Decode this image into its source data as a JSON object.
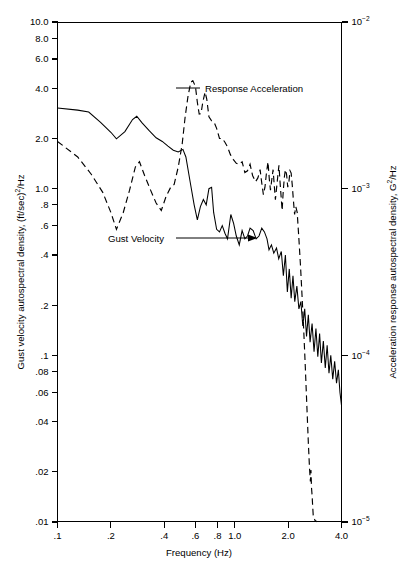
{
  "figure": {
    "background": "#ffffff",
    "ink": "#000000"
  },
  "axes": {
    "x": {
      "title": "Frequency (Hz)",
      "scale": "log",
      "range": [
        0.1,
        4.0
      ],
      "ticks": [
        0.1,
        0.2,
        0.4,
        0.6,
        0.8,
        1.0,
        2.0,
        4.0
      ],
      "tick_labels": [
        ".1",
        ".2",
        ".4",
        ".6",
        ".8",
        "1.0",
        "2.0",
        "4.0"
      ]
    },
    "y_left": {
      "title_parts": {
        "a": "Gust velocity autospectral density, (ft/sec)",
        "sup": "2",
        "b": "/Hz"
      },
      "title": "Gust velocity autospectral density, (ft/sec)2/Hz",
      "scale": "log",
      "range": [
        0.01,
        10.0
      ],
      "ticks": [
        10.0,
        8.0,
        6.0,
        4.0,
        2.0,
        1.0,
        0.8,
        0.6,
        0.4,
        0.2,
        0.1,
        0.08,
        0.06,
        0.04,
        0.02,
        0.01
      ],
      "tick_labels": [
        "10.0",
        "8.0",
        "6.0",
        "4.0",
        "2.0",
        "1.0",
        ".8",
        ".6",
        ".4",
        ".2",
        ".1",
        ".08",
        ".06",
        ".04",
        ".02",
        ".01"
      ]
    },
    "y_right": {
      "title_parts": {
        "a": "Acceleration response autospectral density, G",
        "sup": "2",
        "b": "/Hz"
      },
      "title": "Acceleration response autospectral density, G2/Hz",
      "scale": "log",
      "range": [
        1e-05,
        0.01
      ],
      "ticks": [
        0.01,
        0.001,
        0.0001,
        1e-05
      ],
      "tick_labels": [
        {
          "mantissa": "10",
          "exponent": "−2"
        },
        {
          "mantissa": "10",
          "exponent": "−3"
        },
        {
          "mantissa": "10",
          "exponent": "−4"
        },
        {
          "mantissa": "10",
          "exponent": "−5"
        }
      ]
    }
  },
  "annotations": [
    {
      "name": "response-acceleration-label",
      "text": "Response Acceleration",
      "x": 205,
      "y": 88
    },
    {
      "name": "gust-velocity-label",
      "text": "Gust Velocity",
      "x": 108,
      "y": 239
    }
  ],
  "chart_data": {
    "type": "line",
    "title": "",
    "xlabel": "Frequency (Hz)",
    "ylabel": "Gust velocity autospectral density, (ft/sec)2/Hz",
    "ylabel_right": "Acceleration response autospectral density, G2/Hz",
    "xscale": "log",
    "yscale": "log",
    "xlim": [
      0.1,
      4.0
    ],
    "ylim": [
      0.01,
      10.0
    ],
    "ylim_right": [
      1e-05,
      0.01
    ],
    "grid": false,
    "legend": "inline-annotations",
    "series": [
      {
        "name": "Gust Velocity",
        "axis": "left",
        "style": "solid",
        "color": "#000000",
        "points": [
          [
            0.1,
            3.05
          ],
          [
            0.13,
            2.96
          ],
          [
            0.15,
            2.88
          ],
          [
            0.175,
            2.5
          ],
          [
            0.2,
            2.18
          ],
          [
            0.215,
            1.99
          ],
          [
            0.24,
            2.2
          ],
          [
            0.265,
            2.6
          ],
          [
            0.28,
            2.72
          ],
          [
            0.3,
            2.48
          ],
          [
            0.33,
            2.22
          ],
          [
            0.36,
            2.02
          ],
          [
            0.39,
            1.92
          ],
          [
            0.42,
            1.8
          ],
          [
            0.45,
            1.7
          ],
          [
            0.48,
            1.66
          ],
          [
            0.51,
            1.72
          ],
          [
            0.53,
            1.55
          ],
          [
            0.56,
            1.1
          ],
          [
            0.59,
            0.8
          ],
          [
            0.615,
            0.65
          ],
          [
            0.64,
            0.78
          ],
          [
            0.665,
            0.86
          ],
          [
            0.69,
            0.8
          ],
          [
            0.715,
            1.0
          ],
          [
            0.74,
            1.02
          ],
          [
            0.76,
            0.72
          ],
          [
            0.79,
            0.57
          ],
          [
            0.82,
            0.55
          ],
          [
            0.85,
            0.6
          ],
          [
            0.88,
            0.54
          ],
          [
            0.91,
            0.5
          ],
          [
            0.95,
            0.7
          ],
          [
            0.985,
            0.62
          ],
          [
            1.02,
            0.52
          ],
          [
            1.06,
            0.46
          ],
          [
            1.1,
            0.56
          ],
          [
            1.14,
            0.5
          ],
          [
            1.18,
            0.52
          ],
          [
            1.22,
            0.58
          ],
          [
            1.27,
            0.56
          ],
          [
            1.32,
            0.5
          ],
          [
            1.37,
            0.52
          ],
          [
            1.42,
            0.58
          ],
          [
            1.47,
            0.55
          ],
          [
            1.52,
            0.5
          ],
          [
            1.56,
            0.43
          ],
          [
            1.61,
            0.46
          ],
          [
            1.66,
            0.41
          ],
          [
            1.72,
            0.44
          ],
          [
            1.77,
            0.38
          ],
          [
            1.83,
            0.42
          ],
          [
            1.88,
            0.3
          ],
          [
            1.93,
            0.4
          ],
          [
            1.98,
            0.24
          ],
          [
            2.03,
            0.33
          ],
          [
            2.08,
            0.22
          ],
          [
            2.13,
            0.3
          ],
          [
            2.18,
            0.21
          ],
          [
            2.24,
            0.26
          ],
          [
            2.3,
            0.19
          ],
          [
            2.36,
            0.21
          ],
          [
            2.42,
            0.15
          ],
          [
            2.48,
            0.19
          ],
          [
            2.54,
            0.13
          ],
          [
            2.6,
            0.175
          ],
          [
            2.66,
            0.12
          ],
          [
            2.73,
            0.155
          ],
          [
            2.8,
            0.105
          ],
          [
            2.87,
            0.145
          ],
          [
            2.94,
            0.098
          ],
          [
            3.01,
            0.135
          ],
          [
            3.08,
            0.09
          ],
          [
            3.16,
            0.122
          ],
          [
            3.24,
            0.084
          ],
          [
            3.32,
            0.115
          ],
          [
            3.4,
            0.078
          ],
          [
            3.48,
            0.1
          ],
          [
            3.57,
            0.072
          ],
          [
            3.66,
            0.092
          ],
          [
            3.75,
            0.068
          ],
          [
            3.84,
            0.082
          ],
          [
            3.92,
            0.06
          ],
          [
            4.0,
            0.05
          ]
        ]
      },
      {
        "name": "Response Acceleration",
        "axis": "right",
        "style": "dashed",
        "color": "#000000",
        "points": [
          [
            0.1,
            1.92
          ],
          [
            0.13,
            1.55
          ],
          [
            0.155,
            1.22
          ],
          [
            0.18,
            0.95
          ],
          [
            0.2,
            0.72
          ],
          [
            0.215,
            0.57
          ],
          [
            0.235,
            0.72
          ],
          [
            0.255,
            0.98
          ],
          [
            0.275,
            1.35
          ],
          [
            0.29,
            1.45
          ],
          [
            0.31,
            1.2
          ],
          [
            0.335,
            0.98
          ],
          [
            0.36,
            0.82
          ],
          [
            0.385,
            0.74
          ],
          [
            0.41,
            0.9
          ],
          [
            0.435,
            1.02
          ],
          [
            0.455,
            1.06
          ],
          [
            0.48,
            1.35
          ],
          [
            0.505,
            1.85
          ],
          [
            0.525,
            2.7
          ],
          [
            0.545,
            3.6
          ],
          [
            0.565,
            4.35
          ],
          [
            0.58,
            4.45
          ],
          [
            0.6,
            4.1
          ],
          [
            0.615,
            3.3
          ],
          [
            0.63,
            2.8
          ],
          [
            0.645,
            2.82
          ],
          [
            0.66,
            3.3
          ],
          [
            0.68,
            3.8
          ],
          [
            0.695,
            3.45
          ],
          [
            0.715,
            2.7
          ],
          [
            0.74,
            2.55
          ],
          [
            0.765,
            2.5
          ],
          [
            0.79,
            2.3
          ],
          [
            0.82,
            2.0
          ],
          [
            0.85,
            2.0
          ],
          [
            0.88,
            1.9
          ],
          [
            0.91,
            1.78
          ],
          [
            0.945,
            1.6
          ],
          [
            0.98,
            1.5
          ],
          [
            1.02,
            1.42
          ],
          [
            1.06,
            1.4
          ],
          [
            1.1,
            1.45
          ],
          [
            1.14,
            1.25
          ],
          [
            1.18,
            1.28
          ],
          [
            1.22,
            1.4
          ],
          [
            1.26,
            1.2
          ],
          [
            1.31,
            1.1
          ],
          [
            1.35,
            1.16
          ],
          [
            1.39,
            1.3
          ],
          [
            1.42,
            1.08
          ],
          [
            1.45,
            0.92
          ],
          [
            1.48,
            1.02
          ],
          [
            1.51,
            1.25
          ],
          [
            1.54,
            1.45
          ],
          [
            1.565,
            1.15
          ],
          [
            1.59,
            0.98
          ],
          [
            1.615,
            1.12
          ],
          [
            1.645,
            1.3
          ],
          [
            1.67,
            1.05
          ],
          [
            1.695,
            0.86
          ],
          [
            1.72,
            1.0
          ],
          [
            1.75,
            1.2
          ],
          [
            1.775,
            1.38
          ],
          [
            1.8,
            1.1
          ],
          [
            1.825,
            0.9
          ],
          [
            1.85,
            0.74
          ],
          [
            1.875,
            0.95
          ],
          [
            1.905,
            1.18
          ],
          [
            1.93,
            1.3
          ],
          [
            1.96,
            1.22
          ],
          [
            1.99,
            1.02
          ],
          [
            2.02,
            1.1
          ],
          [
            2.05,
            1.28
          ],
          [
            2.08,
            1.24
          ],
          [
            2.11,
            1.05
          ],
          [
            2.14,
            0.86
          ],
          [
            2.175,
            0.7
          ],
          [
            2.21,
            0.78
          ],
          [
            2.25,
            0.72
          ],
          [
            2.3,
            0.5
          ],
          [
            2.35,
            0.34
          ],
          [
            2.4,
            0.22
          ],
          [
            2.45,
            0.14
          ],
          [
            2.5,
            0.085
          ],
          [
            2.55,
            0.05
          ],
          [
            2.6,
            0.03
          ],
          [
            2.64,
            0.021
          ],
          [
            2.67,
            0.0175
          ],
          [
            2.69,
            0.0205
          ],
          [
            2.71,
            0.016
          ],
          [
            2.73,
            0.0145
          ],
          [
            2.75,
            0.0125
          ],
          [
            2.77,
            0.011
          ],
          [
            2.8,
            0.0105
          ],
          [
            2.84,
            0.0102
          ],
          [
            2.88,
            0.0101
          ],
          [
            2.9,
            0.01
          ]
        ]
      }
    ]
  }
}
